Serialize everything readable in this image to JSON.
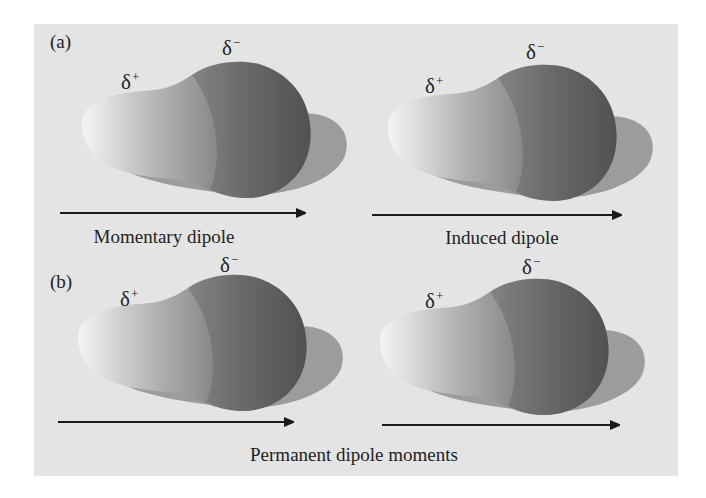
{
  "figure": {
    "background_color": "#e4e4e4",
    "arrow_color": "#1a1a1a",
    "molecule_colors": {
      "tail_light": "#f2f2f2",
      "head_dark": "#555555",
      "shadow": "#9a9a9a"
    },
    "panels": [
      {
        "label": "(a)",
        "molecules": [
          {
            "delta_plus": "δ",
            "plus_sign": "+",
            "delta_minus": "δ",
            "minus_sign": "−"
          },
          {
            "delta_plus": "δ",
            "plus_sign": "+",
            "delta_minus": "δ",
            "minus_sign": "−"
          }
        ],
        "captions": [
          "Momentary dipole",
          "Induced dipole"
        ]
      },
      {
        "label": "(b)",
        "molecules": [
          {
            "delta_plus": "δ",
            "plus_sign": "+",
            "delta_minus": "δ",
            "minus_sign": "−"
          },
          {
            "delta_plus": "δ",
            "plus_sign": "+",
            "delta_minus": "δ",
            "minus_sign": "−"
          }
        ],
        "captions": [
          "Permanent dipole moments"
        ]
      }
    ]
  }
}
